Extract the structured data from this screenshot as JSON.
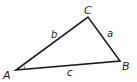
{
  "diagram": {
    "type": "triangle",
    "vertices": {
      "A": {
        "label": "A",
        "x": 16,
        "y": 70
      },
      "B": {
        "label": "B",
        "x": 120,
        "y": 61
      },
      "C": {
        "label": "C",
        "x": 88,
        "y": 17
      }
    },
    "sides": {
      "a": {
        "label": "a",
        "between": [
          "B",
          "C"
        ]
      },
      "b": {
        "label": "b",
        "between": [
          "A",
          "C"
        ]
      },
      "c": {
        "label": "c",
        "between": [
          "A",
          "B"
        ]
      }
    },
    "angle_marker": "A",
    "stroke_color": "#1a1a1a"
  }
}
